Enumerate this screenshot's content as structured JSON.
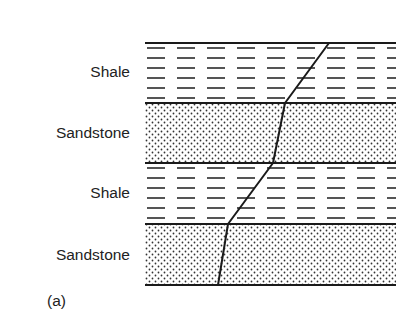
{
  "diagram": {
    "caption": "(a)",
    "layers": [
      {
        "name": "Shale",
        "pattern": "dashes",
        "top": 43,
        "bottom": 103,
        "label_y": 61
      },
      {
        "name": "Sandstone",
        "pattern": "dots",
        "top": 103,
        "bottom": 163,
        "label_y": 122
      },
      {
        "name": "Shale",
        "pattern": "dashes",
        "top": 163,
        "bottom": 224,
        "label_y": 182
      },
      {
        "name": "Sandstone",
        "pattern": "dots",
        "top": 224,
        "bottom": 285,
        "label_y": 245
      }
    ],
    "block": {
      "left": 145,
      "right": 396
    },
    "boundaries_y": [
      43,
      103,
      163,
      224,
      285
    ],
    "fault_line_points": [
      [
        329,
        43
      ],
      [
        285,
        103
      ],
      [
        273,
        163
      ],
      [
        228,
        224
      ],
      [
        218,
        285
      ]
    ],
    "colors": {
      "ink": "#1a1a1a",
      "background": "#ffffff"
    }
  }
}
